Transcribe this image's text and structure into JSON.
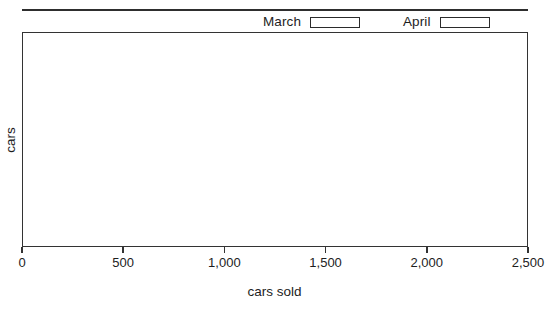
{
  "chart_data": {
    "type": "bar",
    "title": "",
    "subtitle": "",
    "xlabel": "cars sold",
    "ylabel": "cars",
    "orientation": "horizontal",
    "grid": false,
    "legend_position": "top-right",
    "xlim": [
      0,
      2500
    ],
    "xticks": [
      0,
      500,
      1000,
      1500,
      2000,
      2500
    ],
    "xtick_labels": [
      "0",
      "500",
      "1,000",
      "1,500",
      "2,000",
      "2,500"
    ],
    "yticks": [],
    "ytick_labels": [],
    "categories": [],
    "series": [
      {
        "name": "March",
        "values": [],
        "fill": "#ffffff",
        "edge": "#2b2b2b"
      },
      {
        "name": "April",
        "values": [],
        "fill": "#ffffff",
        "edge": "#2b2b2b"
      }
    ],
    "annotations": [],
    "note": "plot area is empty - no bars plotted"
  },
  "legend": {
    "entries": [
      {
        "label": "March",
        "swatch_fill": "#ffffff",
        "swatch_border": "#2b2b2b"
      },
      {
        "label": "April",
        "swatch_fill": "#ffffff",
        "swatch_border": "#2b2b2b"
      }
    ]
  },
  "axes": {
    "x_title": "cars sold",
    "y_title": "cars",
    "x_tick_labels": [
      "0",
      "500",
      "1,000",
      "1,500",
      "2,000",
      "2,500"
    ]
  },
  "colors": {
    "line": "#333333",
    "rule": "#2e2e2e",
    "text": "#1d1d1d",
    "plot_background": "#ffffff",
    "page_background": "#ffffff"
  }
}
